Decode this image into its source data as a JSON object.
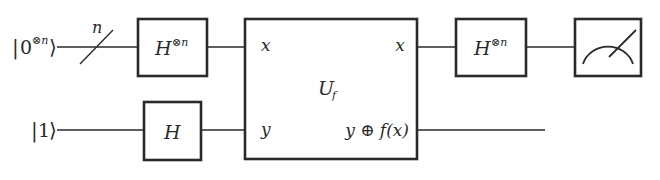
{
  "diagram": {
    "inputs": {
      "top": {
        "ket_open": "|",
        "ket_value": "0",
        "ket_sup": "⊗n",
        "ket_close": "⟩"
      },
      "bottom": {
        "ket_open": "|",
        "ket_value": "1",
        "ket_close": "⟩"
      }
    },
    "bundle_label": "n",
    "gates": {
      "hadamard_n_in": {
        "base": "H",
        "sup": "⊗n"
      },
      "hadamard_single": {
        "base": "H"
      },
      "oracle": {
        "name_base": "U",
        "name_sub": "f",
        "in_top": "x",
        "in_bottom": "y",
        "out_top": "x",
        "out_bottom": "y ⊕ f(x)"
      },
      "hadamard_n_out": {
        "base": "H",
        "sup": "⊗n"
      },
      "measurement": {
        "icon": "meter-icon"
      }
    }
  }
}
